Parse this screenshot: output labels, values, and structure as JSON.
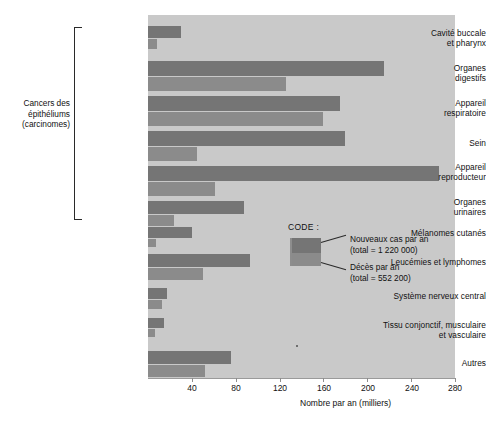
{
  "chart_data": {
    "type": "bar",
    "orientation": "horizontal",
    "title": "",
    "xlabel": "Nombre par an (milliers)",
    "ylabel": "",
    "xlim": [
      0,
      280
    ],
    "xticks": [
      40,
      80,
      120,
      160,
      200,
      240,
      280
    ],
    "grid": false,
    "legend_position": "inside-right",
    "categories": [
      "Cavité buccale\net pharynx",
      "Organes\ndigestifs",
      "Appareil\nrespiratoire",
      "Sein",
      "Appareil\nreproducteur",
      "Organes\nurinaires",
      "Mélanomes cutanés",
      "Leucémies et lymphomes",
      "Système nerveux central",
      "Tissu conjonctif, musculaire\net vasculaire",
      "Autres"
    ],
    "series": [
      {
        "name": "Nouveaux cas par an",
        "total_label": "(total = 1 220 000)",
        "color": "#757575",
        "values": [
          30,
          215,
          175,
          180,
          265,
          88,
          40,
          93,
          17,
          15,
          76
        ]
      },
      {
        "name": "Décès par an",
        "total_label": "(total = 552 200)",
        "color": "#8b8b8b",
        "values": [
          8,
          126,
          160,
          45,
          61,
          24,
          7,
          50,
          13,
          6,
          52
        ]
      }
    ],
    "group_bracket": {
      "label": "Cancers des\népithéliums\n(carcinomes)",
      "covers": [
        0,
        1,
        2,
        3,
        4,
        5
      ]
    },
    "legend": {
      "title": "CODE :",
      "entries": [
        {
          "label": "Nouveaux cas par an",
          "sub": "(total = 1 220 000)"
        },
        {
          "label": "Décès par an",
          "sub": "(total = 552 200)"
        }
      ]
    }
  },
  "labels": {
    "group_title_l1": "Cancers des",
    "group_title_l2": "épithéliums",
    "group_title_l3": "(carcinomes)",
    "cat0_l1": "Cavité buccale",
    "cat0_l2": "et pharynx",
    "cat1_l1": "Organes",
    "cat1_l2": "digestifs",
    "cat2_l1": "Appareil",
    "cat2_l2": "respiratoire",
    "cat3_l1": "Sein",
    "cat4_l1": "Appareil",
    "cat4_l2": "reproducteur",
    "cat5_l1": "Organes",
    "cat5_l2": "urinaires",
    "cat6_l1": "Mélanomes cutanés",
    "cat7_l1": "Leucémies et lymphomes",
    "cat8_l1": "Système nerveux central",
    "cat9_l1": "Tissu conjonctif, musculaire",
    "cat9_l2": "et vasculaire",
    "cat10_l1": "Autres"
  },
  "axis": {
    "title": "Nombre par an (milliers)",
    "t0": "40",
    "t1": "80",
    "t2": "120",
    "t3": "160",
    "t4": "200",
    "t5": "240",
    "t6": "280"
  },
  "legend_ui": {
    "title": "CODE :",
    "line1": "Nouveaux cas par an",
    "line2": "(total = 1 220 000)",
    "line3": "Décès par an",
    "line4": "(total = 552 200)"
  }
}
